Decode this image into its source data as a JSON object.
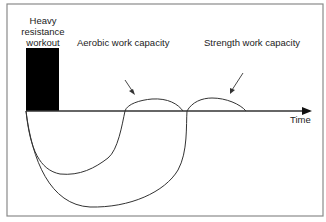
{
  "diagram": {
    "workout_label": "Heavy resistance workout",
    "annotations": {
      "aerobic": "Aerobic work capacity",
      "strength": "Strength work capacity"
    },
    "axis": {
      "label": "Time"
    },
    "colors": {
      "line": "#333333",
      "bar": "#000000",
      "frame": "#8a8a8a"
    }
  }
}
